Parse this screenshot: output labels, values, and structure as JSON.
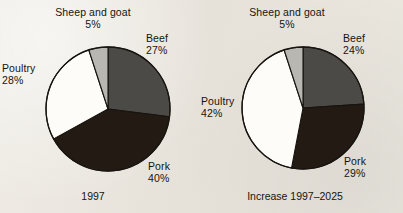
{
  "background_color": "#e9e6de",
  "chart_data": [
    {
      "type": "pie",
      "title": "1997",
      "caption": "1997",
      "labels": [
        "Sheep and goat",
        "Beef",
        "Pork",
        "Poultry"
      ],
      "values": [
        5,
        27,
        40,
        28
      ],
      "value_labels": [
        "5%",
        "27%",
        "40%",
        "28%"
      ],
      "unit": "%",
      "colors": [
        "#b9b7b1",
        "#4c4a46",
        "#221a13",
        "#fdfcf8"
      ],
      "legend": "none",
      "start_angle_deg": 0,
      "direction": "clockwise"
    },
    {
      "type": "pie",
      "title": "Increase 1997–2025",
      "caption": "Increase 1997–2025",
      "labels": [
        "Sheep and goat",
        "Beef",
        "Pork",
        "Poultry"
      ],
      "values": [
        5,
        24,
        29,
        42
      ],
      "value_labels": [
        "5%",
        "24%",
        "29%",
        "42%"
      ],
      "unit": "%",
      "colors": [
        "#b9b7b1",
        "#4c4a46",
        "#221a13",
        "#fdfcf8"
      ],
      "legend": "none",
      "start_angle_deg": 0,
      "direction": "clockwise"
    }
  ],
  "left_chart": {
    "caption": "1997",
    "slices": {
      "sheep": {
        "name": "Sheep and goat",
        "pct": "5%"
      },
      "beef": {
        "name": "Beef",
        "pct": "27%"
      },
      "pork": {
        "name": "Pork",
        "pct": "40%"
      },
      "poultry": {
        "name": "Poultry",
        "pct": "28%"
      }
    }
  },
  "right_chart": {
    "caption": "Increase 1997–2025",
    "slices": {
      "sheep": {
        "name": "Sheep and goat",
        "pct": "5%"
      },
      "beef": {
        "name": "Beef",
        "pct": "24%"
      },
      "pork": {
        "name": "Pork",
        "pct": "29%"
      },
      "poultry": {
        "name": "Poultry",
        "pct": "42%"
      }
    }
  }
}
